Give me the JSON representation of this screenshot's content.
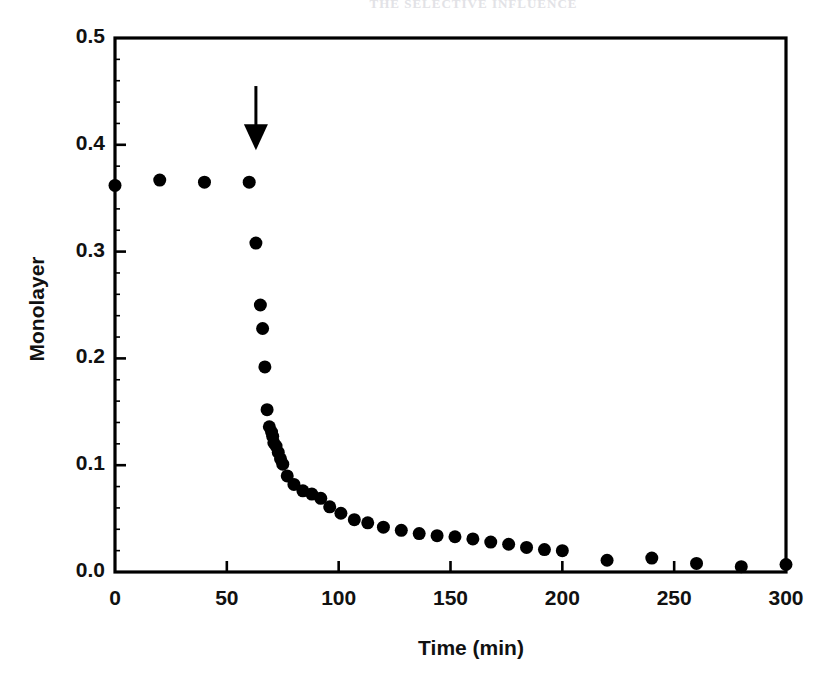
{
  "page": {
    "running_header": "THE SELECTIVE INFLUENCE"
  },
  "figure": {
    "plot_area": {
      "left": 115,
      "top": 38,
      "right": 786,
      "bottom": 572
    },
    "frame_color": "#000000",
    "marker_color": "#000000",
    "annotation": {
      "type": "arrow-down",
      "name": "injection-arrow",
      "x_value": 63,
      "y_from": 0.455,
      "y_to": 0.395
    }
  },
  "chart_data": {
    "type": "scatter",
    "title": "",
    "xlabel": "Time (min)",
    "ylabel": "Monolayer",
    "xlim": [
      0,
      300
    ],
    "ylim": [
      0.0,
      0.5
    ],
    "xticks": [
      0,
      50,
      100,
      150,
      200,
      250,
      300
    ],
    "xtick_labels": [
      "0",
      "50",
      "100",
      "150",
      "200",
      "250",
      "300"
    ],
    "yticks": [
      0.0,
      0.1,
      0.2,
      0.3,
      0.4,
      0.5
    ],
    "ytick_labels": [
      "0.0",
      "0.1",
      "0.2",
      "0.3",
      "0.4",
      "0.5"
    ],
    "grid": false,
    "legend": null,
    "marker": "filled-circle",
    "marker_size_px": 13,
    "series": [
      {
        "name": "Monolayer coverage",
        "x": [
          0,
          20,
          40,
          60,
          63,
          65,
          66,
          67,
          68,
          69,
          70,
          70.5,
          71,
          72,
          73,
          74,
          75,
          77,
          80,
          84,
          88,
          92,
          96,
          101,
          107,
          113,
          120,
          128,
          136,
          144,
          152,
          160,
          168,
          176,
          184,
          192,
          200,
          220,
          240,
          260,
          280,
          300
        ],
        "y": [
          0.362,
          0.367,
          0.365,
          0.365,
          0.308,
          0.25,
          0.228,
          0.192,
          0.152,
          0.136,
          0.131,
          0.127,
          0.121,
          0.118,
          0.112,
          0.106,
          0.101,
          0.09,
          0.082,
          0.076,
          0.073,
          0.069,
          0.061,
          0.055,
          0.049,
          0.046,
          0.042,
          0.039,
          0.036,
          0.034,
          0.033,
          0.031,
          0.028,
          0.026,
          0.023,
          0.021,
          0.02,
          0.011,
          0.013,
          0.008,
          0.005,
          0.007
        ]
      }
    ],
    "annotations": [
      {
        "label": "",
        "kind": "arrow-down",
        "x": 63,
        "y_top": 0.455,
        "y_tip": 0.395
      }
    ]
  }
}
